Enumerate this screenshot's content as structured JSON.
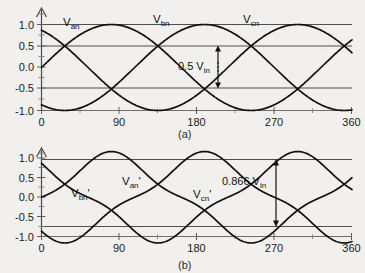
{
  "figure": {
    "background_color": "#f2f0ee",
    "ink_color": "#101010",
    "panel_a_label": "(a)",
    "panel_b_label": "(b)"
  },
  "chart_data": [
    {
      "id": "panel-a",
      "type": "line",
      "title": "",
      "subtitle": "(a)",
      "xlabel": "",
      "ylabel": "",
      "xlim": [
        0,
        400
      ],
      "ylim": [
        -1.15,
        1.15
      ],
      "grid": false,
      "legend_position": "inline-annotations",
      "xticks": [
        0,
        90,
        180,
        270,
        360
      ],
      "xtick_labels": [
        "0",
        "90",
        "180",
        "270",
        "360"
      ],
      "x_minor_ticks": [
        45,
        135,
        225,
        315
      ],
      "yticks": [
        -1.0,
        -0.5,
        0.0,
        0.5,
        1.0
      ],
      "ytick_labels": [
        "-1.0",
        "-0.5",
        "0.0",
        "0.5",
        "1.0"
      ],
      "reference_lines": [
        {
          "value": 1.0,
          "style": "solid"
        },
        {
          "value": 0.5,
          "style": "solid"
        },
        {
          "value": -0.5,
          "style": "solid"
        },
        {
          "value": -1.0,
          "style": "solid"
        }
      ],
      "series": [
        {
          "name": "V_an",
          "label": "V",
          "sub": "an",
          "phase_deg": 0,
          "amplitude": 1.0,
          "waveform": "sine"
        },
        {
          "name": "V_bn",
          "label": "V",
          "sub": "bn",
          "phase_deg": -120,
          "amplitude": 1.0,
          "waveform": "sine"
        },
        {
          "name": "V_cn",
          "label": "V",
          "sub": "cn",
          "phase_deg": -240,
          "amplitude": 1.0,
          "waveform": "sine"
        }
      ],
      "annotations": [
        {
          "text": "0.5 V",
          "sub": "in",
          "value": 0.5,
          "from_y": 0.5,
          "to_y": -0.5,
          "at_x_deg": 205,
          "arrow": "double-headed-vertical"
        }
      ]
    },
    {
      "id": "panel-b",
      "type": "line",
      "title": "",
      "subtitle": "(b)",
      "xlabel": "",
      "ylabel": "",
      "xlim": [
        0,
        400
      ],
      "ylim": [
        -1.15,
        1.15
      ],
      "grid": false,
      "legend_position": "inline-annotations",
      "xticks": [
        0,
        90,
        180,
        270,
        360
      ],
      "xtick_labels": [
        "0",
        "90",
        "180",
        "270",
        "360"
      ],
      "x_minor_ticks": [
        45,
        135,
        225,
        315
      ],
      "yticks": [
        -1.0,
        -0.5,
        0.0,
        0.5,
        1.0
      ],
      "ytick_labels": [
        "-1.0",
        "-0.5",
        "0.0",
        "0.5",
        "1.0"
      ],
      "reference_lines": [
        {
          "value": 0.92,
          "style": "solid"
        },
        {
          "value": -0.8,
          "style": "solid"
        },
        {
          "value": -1.0,
          "style": "solid"
        }
      ],
      "series": [
        {
          "name": "V_an_prime",
          "label": "V",
          "sub": "an",
          "prime": "'",
          "phase_deg": 0,
          "amplitude": 0.866,
          "waveform": "third-harmonic-injected"
        },
        {
          "name": "V_bn_prime",
          "label": "V",
          "sub": "bn",
          "prime": "'",
          "phase_deg": -120,
          "amplitude": 0.866,
          "waveform": "third-harmonic-injected"
        },
        {
          "name": "V_cn_prime",
          "label": "V",
          "sub": "cn",
          "prime": "'",
          "phase_deg": -240,
          "amplitude": 0.866,
          "waveform": "third-harmonic-injected"
        }
      ],
      "annotations": [
        {
          "text": "0.866 V",
          "sub": "in",
          "value": 0.866,
          "from_y": 0.9,
          "to_y": -0.8,
          "at_x_deg": 272,
          "arrow": "double-headed-vertical"
        }
      ]
    }
  ],
  "panel_a": {
    "labels": {
      "van": "V",
      "van_sub": "an",
      "vbn": "V",
      "vbn_sub": "bn",
      "vcn": "V",
      "vcn_sub": "cn"
    },
    "annotation": {
      "text": "0.5 V",
      "sub": "in"
    },
    "yticks": [
      "1.0",
      "0.5",
      "0.0",
      "-0.5",
      "-1.0"
    ],
    "xticks": [
      "0",
      "90",
      "180",
      "270",
      "360"
    ],
    "caption": "(a)"
  },
  "panel_b": {
    "labels": {
      "van": "V",
      "van_sub": "an",
      "van_prime": "'",
      "vbn": "V",
      "vbn_sub": "bn",
      "vbn_prime": "'",
      "vcn": "V",
      "vcn_sub": "cn",
      "vcn_prime": "'"
    },
    "annotation": {
      "text": "0.866 V",
      "sub": "in"
    },
    "yticks": [
      "1.0",
      "0.5",
      "0.0",
      "-0.5",
      "-1.0"
    ],
    "xticks": [
      "0",
      "90",
      "180",
      "270",
      "360"
    ],
    "caption": "(b)"
  }
}
